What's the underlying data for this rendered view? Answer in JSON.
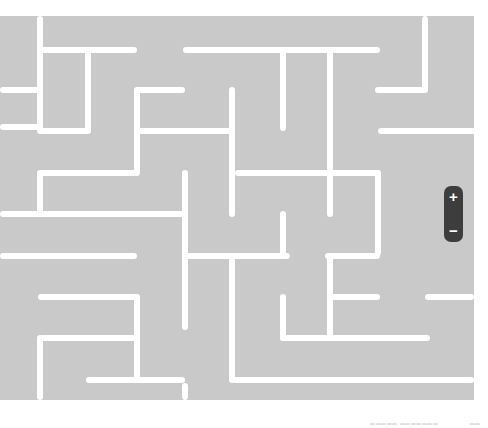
{
  "maze": {
    "background": "#c9c9c9",
    "wall_color": "#ffffff",
    "walls": [
      {
        "x": 40,
        "y": 47,
        "w": 97,
        "h": 6
      },
      {
        "x": 183,
        "y": 47,
        "w": 197,
        "h": 6
      },
      {
        "x": 0,
        "y": 87,
        "w": 43,
        "h": 6
      },
      {
        "x": 135,
        "y": 87,
        "w": 50,
        "h": 6
      },
      {
        "x": 375,
        "y": 87,
        "w": 52,
        "h": 6
      },
      {
        "x": 40,
        "y": 128,
        "w": 50,
        "h": 6
      },
      {
        "x": 137,
        "y": 128,
        "w": 98,
        "h": 6
      },
      {
        "x": 378,
        "y": 128,
        "w": 110,
        "h": 6
      },
      {
        "x": 40,
        "y": 170,
        "w": 97,
        "h": 6
      },
      {
        "x": 235,
        "y": 170,
        "w": 145,
        "h": 6
      },
      {
        "x": 0,
        "y": 211,
        "w": 186,
        "h": 6
      },
      {
        "x": 0,
        "y": 253,
        "w": 137,
        "h": 6
      },
      {
        "x": 183,
        "y": 253,
        "w": 107,
        "h": 6
      },
      {
        "x": 325,
        "y": 253,
        "w": 55,
        "h": 6
      },
      {
        "x": 38,
        "y": 294,
        "w": 99,
        "h": 6
      },
      {
        "x": 330,
        "y": 294,
        "w": 50,
        "h": 6
      },
      {
        "x": 425,
        "y": 294,
        "w": 49,
        "h": 6
      },
      {
        "x": 40,
        "y": 335,
        "w": 97,
        "h": 6
      },
      {
        "x": 280,
        "y": 335,
        "w": 150,
        "h": 6
      },
      {
        "x": 86,
        "y": 377,
        "w": 99,
        "h": 6
      },
      {
        "x": 232,
        "y": 377,
        "w": 242,
        "h": 6
      },
      {
        "x": 37,
        "y": 16,
        "w": 6,
        "h": 118
      },
      {
        "x": 37,
        "y": 170,
        "w": 6,
        "h": 47
      },
      {
        "x": 37,
        "y": 335,
        "w": 6,
        "h": 65
      },
      {
        "x": 85,
        "y": 47,
        "w": 6,
        "h": 87
      },
      {
        "x": 134,
        "y": 87,
        "w": 6,
        "h": 89
      },
      {
        "x": 134,
        "y": 294,
        "w": 6,
        "h": 89
      },
      {
        "x": 182,
        "y": 170,
        "w": 6,
        "h": 160
      },
      {
        "x": 182,
        "y": 383,
        "w": 6,
        "h": 17
      },
      {
        "x": 229,
        "y": 87,
        "w": 6,
        "h": 130
      },
      {
        "x": 229,
        "y": 253,
        "w": 6,
        "h": 130
      },
      {
        "x": 280,
        "y": 47,
        "w": 6,
        "h": 84
      },
      {
        "x": 280,
        "y": 211,
        "w": 6,
        "h": 45
      },
      {
        "x": 280,
        "y": 294,
        "w": 6,
        "h": 47
      },
      {
        "x": 327,
        "y": 47,
        "w": 6,
        "h": 170
      },
      {
        "x": 327,
        "y": 253,
        "w": 6,
        "h": 88
      },
      {
        "x": 375,
        "y": 170,
        "w": 6,
        "h": 86
      },
      {
        "x": 422,
        "y": 16,
        "w": 6,
        "h": 77
      },
      {
        "x": 0,
        "y": 124,
        "w": 43,
        "h": 6
      }
    ]
  },
  "zoom_control": {
    "zoom_in_label": "+",
    "zoom_out_label": "−"
  },
  "footer": {
    "attribution": "▁▁▁▁▁ ▁▁▁▁▁▁▁",
    "right": "▁▁"
  }
}
